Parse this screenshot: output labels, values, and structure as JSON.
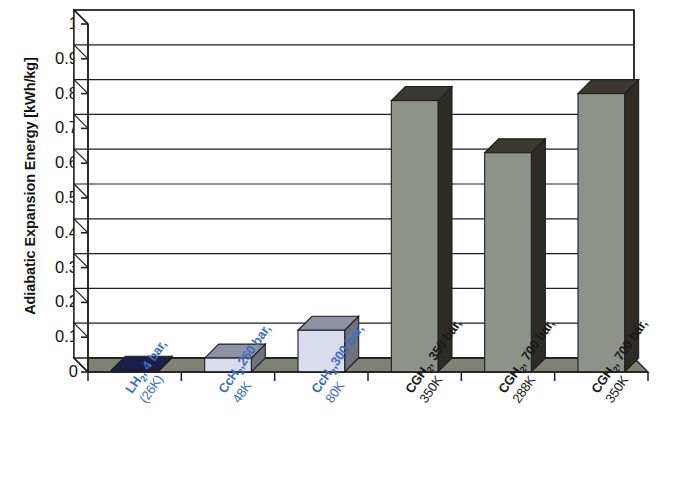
{
  "chart_data": {
    "type": "bar",
    "title": "",
    "subtitle": "",
    "xlabel": "",
    "ylabel": "Adiabatic Expansion Energy [kWh/kg]",
    "ylim": [
      0,
      1
    ],
    "ytick_labels": [
      "1",
      "0.9",
      "0.8",
      "0.7",
      "0.6",
      "0.5",
      "0.4",
      "0.3",
      "0.2",
      "0.1",
      "0"
    ],
    "ytick_values": [
      1,
      0.9,
      0.8,
      0.7,
      0.6,
      0.5,
      0.4,
      0.3,
      0.2,
      0.1,
      0
    ],
    "grid": true,
    "grid_axis": "y",
    "legend": false,
    "legend_position": "none",
    "three_d": true,
    "categories": [
      "LH2, 4 bar, (26K)",
      "CcH2, 250 bar, 48K",
      "CcH2, 300 bar, 80K",
      "CGH2, 350 bar, 350K",
      "CGH2, 700 bar, 288K",
      "CGH2, 700 bar, 350K"
    ],
    "category_lines": [
      {
        "line1_pre": "LH",
        "line1_sub": "2",
        "line1_post": ", 4 bar,",
        "line2": "(26K)",
        "color": "blue"
      },
      {
        "line1_pre": "CcH",
        "line1_sub": "2",
        "line1_post": ",250 bar,",
        "line2": "48K",
        "color": "blue"
      },
      {
        "line1_pre": "CcH",
        "line1_sub": "2",
        "line1_post": ",300 bar,",
        "line2": "80K",
        "color": "blue"
      },
      {
        "line1_pre": "CGH",
        "line1_sub": "2",
        "line1_post": ", 350 bar,",
        "line2": "350K",
        "color": "black"
      },
      {
        "line1_pre": "CGH",
        "line1_sub": "2",
        "line1_post": ", 700 bar,",
        "line2": "288K",
        "color": "black"
      },
      {
        "line1_pre": "CGH",
        "line1_sub": "2",
        "line1_post": ", 700 bar,",
        "line2": "350K",
        "color": "black"
      }
    ],
    "values": [
      0.005,
      0.04,
      0.12,
      0.78,
      0.63,
      0.8
    ],
    "bar_colors": [
      "#262a5e",
      "#d8dced",
      "#d8dced",
      "#8e9389",
      "#8e9389",
      "#8e9389"
    ],
    "bar_side_colors": [
      "#15173a",
      "#6e7180",
      "#6e7180",
      "#2e2b25",
      "#2e2b25",
      "#2e2b25"
    ],
    "bar_top_colors": [
      "#1c1f4a",
      "#8f92a4",
      "#8f92a4",
      "#3a382f",
      "#3a382f",
      "#3a382f"
    ],
    "axis_color": "#1f1f1f",
    "floor_color": "#7e8376",
    "plot_background": "#ffffff"
  },
  "axis_title_text": "Adiabatic Expansion Energy [kWh/kg]"
}
